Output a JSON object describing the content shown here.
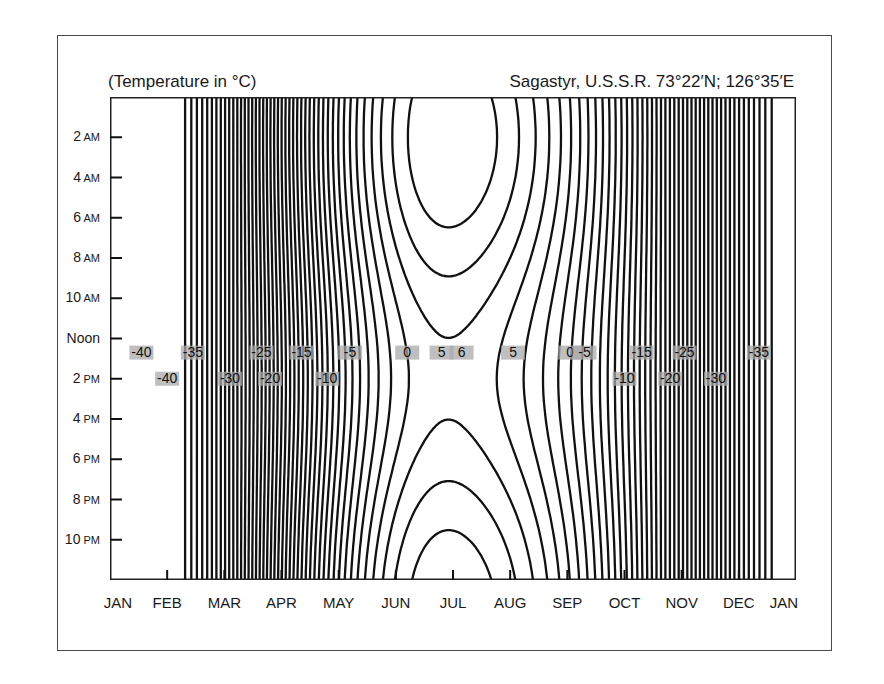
{
  "header": {
    "left": "(Temperature in °C)",
    "right": "Sagastyr, U.S.S.R.  73°22′N; 126°35′E"
  },
  "colors": {
    "background": "#ffffff",
    "frame": "#4a4a4a",
    "plot_fill": "#a9a9a9",
    "plot_fill_warm": "#b6b6b6",
    "plot_fill_cold": "#8e8e8e",
    "contour": "#111111"
  },
  "chart_data": {
    "type": "heatmap",
    "subtype": "contour (isotherm) plot",
    "title": "Sagastyr, U.S.S.R. 73°22′N; 126°35′E",
    "subtitle": "(Temperature in °C)",
    "xlabel": "Month",
    "ylabel": "Time of day",
    "x_ticks": [
      "JAN",
      "FEB",
      "MAR",
      "APR",
      "MAY",
      "JUN",
      "JUL",
      "AUG",
      "SEP",
      "OCT",
      "NOV",
      "DEC",
      "JAN"
    ],
    "y_ticks": [
      "2 AM",
      "4 AM",
      "6 AM",
      "8 AM",
      "10 AM",
      "Noon",
      "2 PM",
      "4 PM",
      "6 PM",
      "8 PM",
      "10 PM"
    ],
    "contour_interval": 1,
    "contour_labels_row1": [
      {
        "x_month": 0.55,
        "value": -40
      },
      {
        "x_month": 1.45,
        "value": -35
      },
      {
        "x_month": 2.65,
        "value": -25
      },
      {
        "x_month": 3.35,
        "value": -15
      },
      {
        "x_month": 4.2,
        "value": -5
      },
      {
        "x_month": 5.2,
        "value": 0
      },
      {
        "x_month": 5.8,
        "value": 5
      },
      {
        "x_month": 6.15,
        "value": 6
      },
      {
        "x_month": 7.05,
        "value": 5
      },
      {
        "x_month": 8.05,
        "value": 0
      },
      {
        "x_month": 8.3,
        "value": -5
      },
      {
        "x_month": 9.3,
        "value": -15
      },
      {
        "x_month": 10.05,
        "value": -25
      },
      {
        "x_month": 11.35,
        "value": -35
      }
    ],
    "contour_labels_row2": [
      {
        "x_month": 1.0,
        "value": -40
      },
      {
        "x_month": 2.1,
        "value": -30
      },
      {
        "x_month": 2.8,
        "value": -20
      },
      {
        "x_month": 3.8,
        "value": -10
      },
      {
        "x_month": 9.0,
        "value": -10
      },
      {
        "x_month": 9.8,
        "value": -20
      },
      {
        "x_month": 10.6,
        "value": -30
      }
    ],
    "key_values": {
      "min_approx": -41,
      "min_location": "early-mid February, all hours",
      "max_approx": 6,
      "max_location": "mid-July, ~Noon to 4 PM",
      "zero_crossings": [
        "late May / early June",
        "early-mid September"
      ]
    },
    "grid": false,
    "legend": "none (inline contour labels)"
  },
  "axes": {
    "y_labels": [
      {
        "num": "2",
        "suffix": "AM"
      },
      {
        "num": "4",
        "suffix": "AM"
      },
      {
        "num": "6",
        "suffix": "AM"
      },
      {
        "num": "8",
        "suffix": "AM"
      },
      {
        "num": "10",
        "suffix": "AM"
      },
      {
        "num": "Noon",
        "suffix": ""
      },
      {
        "num": "2",
        "suffix": "PM"
      },
      {
        "num": "4",
        "suffix": "PM"
      },
      {
        "num": "6",
        "suffix": "PM"
      },
      {
        "num": "8",
        "suffix": "PM"
      },
      {
        "num": "10",
        "suffix": "PM"
      }
    ],
    "x_labels": [
      "JAN",
      "FEB",
      "MAR",
      "APR",
      "MAY",
      "JUN",
      "JUL",
      "AUG",
      "SEP",
      "OCT",
      "NOV",
      "DEC",
      "JAN"
    ]
  }
}
